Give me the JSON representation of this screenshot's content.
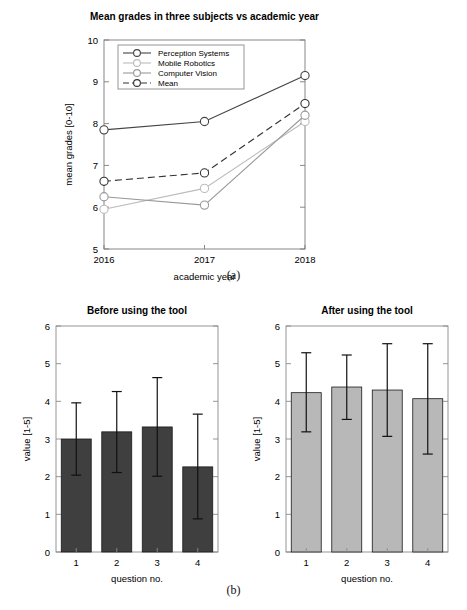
{
  "figure_a": {
    "caption": "(a)",
    "chart_data": {
      "type": "line",
      "title": "Mean grades in three subjects vs academic year",
      "xlabel": "academic year",
      "ylabel": "mean grades [0-10]",
      "categories": [
        "2016",
        "2017",
        "2018"
      ],
      "x": [
        2016,
        2017,
        2018
      ],
      "xlim": [
        2016,
        2018
      ],
      "ylim": [
        5,
        10
      ],
      "yticks": [
        5,
        6,
        7,
        8,
        9,
        10
      ],
      "xticks": [
        2016,
        2017,
        2018
      ],
      "grid": false,
      "legend_position": "top-left",
      "series": [
        {
          "name": "Perception Systems",
          "values": [
            7.85,
            8.05,
            9.15
          ],
          "color": "#444444",
          "style": "solid",
          "marker": "circle"
        },
        {
          "name": "Mobile Robotics",
          "values": [
            5.95,
            6.45,
            8.05
          ],
          "color": "#bcbcbc",
          "style": "solid",
          "marker": "circle"
        },
        {
          "name": "Computer Vision",
          "values": [
            6.25,
            6.05,
            8.2
          ],
          "color": "#9a9a9a",
          "style": "solid",
          "marker": "circle"
        },
        {
          "name": "Mean",
          "values": [
            6.62,
            6.82,
            8.48
          ],
          "color": "#333333",
          "style": "dashed",
          "marker": "circle"
        }
      ]
    }
  },
  "figure_b": {
    "caption": "(b)",
    "charts": [
      {
        "chart_data": {
          "type": "bar",
          "title": "Before using the tool",
          "xlabel": "question no.",
          "ylabel": "value [1-5]",
          "categories": [
            "1",
            "2",
            "3",
            "4"
          ],
          "values": [
            3.0,
            3.19,
            3.32,
            2.26
          ],
          "errors_low": [
            2.04,
            2.11,
            2.01,
            0.88
          ],
          "errors_high": [
            3.96,
            4.26,
            4.63,
            3.66
          ],
          "ylim": [
            0,
            6
          ],
          "yticks": [
            0,
            1,
            2,
            3,
            4,
            5,
            6
          ],
          "bar_color": "#3f3f3f",
          "grid": false
        }
      },
      {
        "chart_data": {
          "type": "bar",
          "title": "After using the tool",
          "xlabel": "question no.",
          "ylabel": "value [1-5]",
          "categories": [
            "1",
            "2",
            "3",
            "4"
          ],
          "values": [
            4.23,
            4.38,
            4.3,
            4.07
          ],
          "errors_low": [
            3.19,
            3.52,
            3.07,
            2.6
          ],
          "errors_high": [
            5.29,
            5.23,
            5.53,
            5.53
          ],
          "ylim": [
            0,
            6
          ],
          "yticks": [
            0,
            1,
            2,
            3,
            4,
            5,
            6
          ],
          "bar_color": "#b8b8b8",
          "grid": false
        }
      }
    ]
  }
}
